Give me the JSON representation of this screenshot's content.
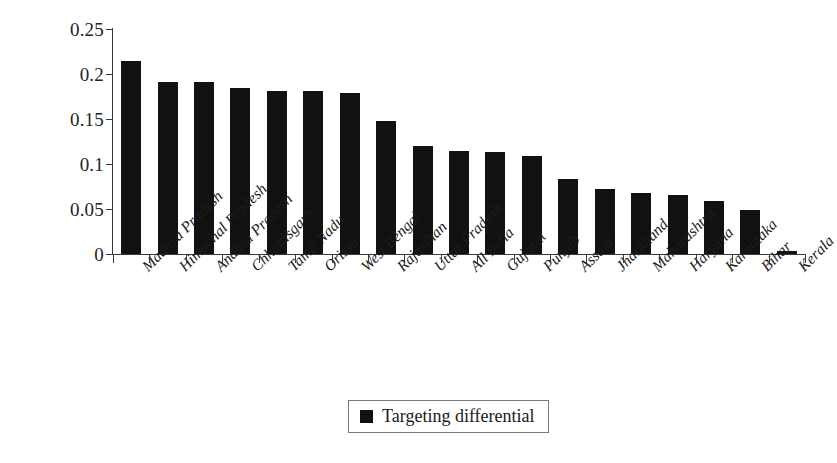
{
  "chart_data": {
    "type": "bar",
    "title": "",
    "subtitle": "",
    "xlabel": "",
    "ylabel": "",
    "ylim": [
      0,
      0.25
    ],
    "ytick_labels": [
      "0",
      "0.05",
      "0.1",
      "0.15",
      "0.2",
      "0.25"
    ],
    "ytick_values": [
      0,
      0.05,
      0.1,
      0.15,
      0.2,
      0.25
    ],
    "grid": false,
    "legend_position": "bottom-center",
    "legend_entries": [
      "Targeting differential"
    ],
    "series_color": "#111111",
    "categories": [
      "Madhya Pradesh",
      "Himachal Pradesh",
      "Andhra Pradesh",
      "Chhattisgarh",
      "Tamil Nadu",
      "Orissa",
      "West Bengal",
      "Rajasthan",
      "Uttar Pradesh",
      "All India",
      "Gujarat",
      "Punjab",
      "Assam",
      "Jharkhand",
      "Maharashtra",
      "Haryana",
      "Karnataka",
      "Bihar",
      "Kerala"
    ],
    "series": [
      {
        "name": "Targeting differential",
        "values": [
          0.215,
          0.191,
          0.191,
          0.185,
          0.181,
          0.181,
          0.179,
          0.148,
          0.12,
          0.115,
          0.113,
          0.109,
          0.083,
          0.072,
          0.068,
          0.066,
          0.059,
          0.049,
          0.003
        ]
      }
    ]
  },
  "legend": {
    "label": "Targeting differential"
  }
}
